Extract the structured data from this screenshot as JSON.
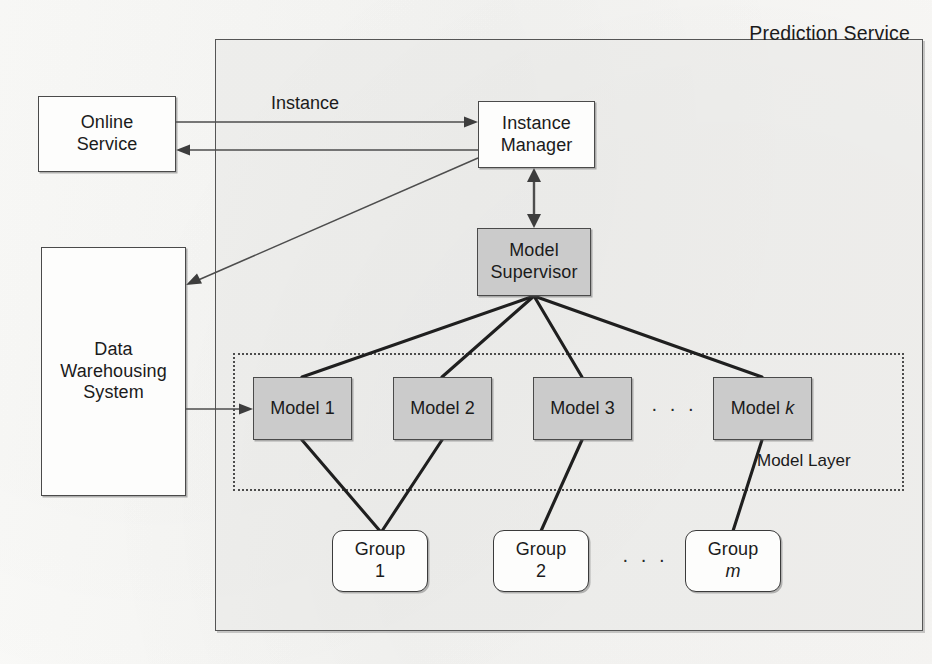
{
  "figure": {
    "type": "architecture-block-diagram",
    "container": {
      "label": "Prediction Service"
    },
    "model_layer": {
      "label": "Model Layer"
    }
  },
  "nodes": {
    "online_service": {
      "line1": "Online",
      "line2": "Service",
      "style": "white"
    },
    "data_warehouse": {
      "line1": "Data",
      "line2": "Warehousing",
      "line3": "System",
      "style": "white"
    },
    "instance_manager": {
      "line1": "Instance",
      "line2": "Manager",
      "style": "white"
    },
    "model_supervisor": {
      "line1": "Model",
      "line2": "Supervisor",
      "style": "gray"
    },
    "model_1": {
      "label": "Model 1",
      "style": "gray"
    },
    "model_2": {
      "label": "Model 2",
      "style": "gray"
    },
    "model_3": {
      "label": "Model 3",
      "style": "gray"
    },
    "model_k": {
      "label_prefix": "Model ",
      "label_symbol": "k",
      "style": "gray"
    },
    "group_1": {
      "line1": "Group",
      "line2": "1",
      "style": "round"
    },
    "group_2": {
      "line1": "Group",
      "line2": "2",
      "style": "round"
    },
    "group_m": {
      "line1": "Group",
      "line2_symbol": "m",
      "style": "round"
    }
  },
  "edge_labels": {
    "instance": "Instance"
  },
  "ellipses": {
    "model_row": "· · ·",
    "group_row": "· · ·"
  },
  "colors": {
    "gray_fill": "#cbcbcb",
    "white_fill": "#fdfdfc",
    "stroke": "#4a4a4a",
    "container_fill": "#e8e8e6",
    "thick_edge": "#1f1f1f",
    "thin_edge": "#4d4d4d"
  }
}
